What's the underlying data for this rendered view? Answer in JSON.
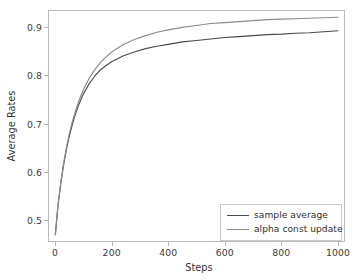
{
  "chart_data": {
    "type": "line",
    "title": "",
    "xlabel": "Steps",
    "ylabel": "Average Rates",
    "xlim": [
      -25,
      1025
    ],
    "ylim": [
      0.455,
      0.935
    ],
    "grid": false,
    "legend_position": "lower right",
    "xticks": [
      0,
      200,
      400,
      600,
      800,
      1000
    ],
    "xtick_labels": [
      "0",
      "200",
      "400",
      "600",
      "800",
      "1000"
    ],
    "yticks": [
      0.5,
      0.6,
      0.7,
      0.8,
      0.9
    ],
    "ytick_labels": [
      "0.5",
      "0.6",
      "0.7",
      "0.8",
      "0.9"
    ],
    "colors": {
      "sample_average": "#4a4a4a",
      "alpha_const_update": "#8c8c8c",
      "axis": "#b9b9b9",
      "text": "#333333",
      "background": "#ffffff"
    },
    "series": [
      {
        "name": "sample average",
        "color": "#4a4a4a",
        "x": [
          1,
          10,
          20,
          30,
          40,
          50,
          60,
          70,
          80,
          90,
          100,
          120,
          140,
          160,
          180,
          200,
          240,
          280,
          320,
          360,
          400,
          450,
          500,
          550,
          600,
          650,
          700,
          750,
          800,
          850,
          900,
          950,
          1000
        ],
        "y": [
          0.47,
          0.528,
          0.575,
          0.614,
          0.646,
          0.673,
          0.696,
          0.716,
          0.733,
          0.748,
          0.761,
          0.782,
          0.798,
          0.811,
          0.82,
          0.828,
          0.84,
          0.848,
          0.855,
          0.86,
          0.864,
          0.869,
          0.872,
          0.875,
          0.878,
          0.88,
          0.882,
          0.884,
          0.885,
          0.887,
          0.888,
          0.89,
          0.892
        ]
      },
      {
        "name": "alpha const update",
        "color": "#8c8c8c",
        "x": [
          1,
          10,
          20,
          30,
          40,
          50,
          60,
          70,
          80,
          90,
          100,
          120,
          140,
          160,
          180,
          200,
          240,
          280,
          320,
          360,
          400,
          450,
          500,
          550,
          600,
          650,
          700,
          750,
          800,
          850,
          900,
          950,
          1000
        ],
        "y": [
          0.47,
          0.53,
          0.578,
          0.617,
          0.65,
          0.678,
          0.702,
          0.722,
          0.74,
          0.756,
          0.77,
          0.793,
          0.811,
          0.826,
          0.838,
          0.848,
          0.863,
          0.874,
          0.882,
          0.889,
          0.894,
          0.899,
          0.903,
          0.907,
          0.909,
          0.911,
          0.913,
          0.915,
          0.916,
          0.917,
          0.918,
          0.919,
          0.92
        ]
      }
    ],
    "annotations": []
  },
  "legend": {
    "entries": [
      {
        "label": "sample average"
      },
      {
        "label": "alpha const update"
      }
    ]
  }
}
